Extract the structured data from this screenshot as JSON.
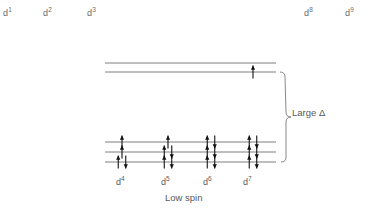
{
  "diagram": {
    "title_caption": "Low spin",
    "delta_label": "Large Δ",
    "accent_color": "#111111",
    "line_color": "#6f7072",
    "text_color": "#58595b",
    "background": "#ffffff"
  },
  "top_labels": [
    {
      "text": "d1",
      "base": "d",
      "sup": "1",
      "x": 3,
      "y": 6
    },
    {
      "text": "d2",
      "base": "d",
      "sup": "2",
      "x": 43,
      "y": 6
    },
    {
      "text": "d3",
      "base": "d",
      "sup": "3",
      "x": 87,
      "y": 6
    },
    {
      "text": "d8",
      "base": "d",
      "sup": "8",
      "x": 304,
      "y": 6
    },
    {
      "text": "d9",
      "base": "d",
      "sup": "9",
      "x": 345,
      "y": 6
    }
  ],
  "column_labels": [
    {
      "base": "d",
      "sup": "4",
      "x": 116,
      "y": 175
    },
    {
      "base": "d",
      "sup": "5",
      "x": 161,
      "y": 175
    },
    {
      "base": "d",
      "sup": "6",
      "x": 203,
      "y": 175
    },
    {
      "base": "d",
      "sup": "7",
      "x": 243,
      "y": 175
    }
  ],
  "chart_data": {
    "type": "diagram",
    "title": "Low spin",
    "annotation": "Large Δ",
    "level_sets": [
      {
        "name": "eg",
        "lines": [
          {
            "y": 63
          },
          {
            "y": 72
          }
        ]
      },
      {
        "name": "t2g",
        "lines": [
          {
            "y": 142
          },
          {
            "y": 152
          },
          {
            "y": 162
          }
        ]
      }
    ],
    "line_extent": {
      "x1": 105,
      "x2": 276
    },
    "columns": [
      {
        "label": "d4",
        "center_x": 122,
        "eg_electrons": [
          0,
          0
        ],
        "t2g_electrons": [
          1,
          1,
          2
        ]
      },
      {
        "label": "d5",
        "center_x": 168,
        "eg_electrons": [
          0,
          0
        ],
        "t2g_electrons": [
          1,
          2,
          2
        ]
      },
      {
        "label": "d6",
        "center_x": 211,
        "eg_electrons": [
          0,
          0
        ],
        "t2g_electrons": [
          2,
          2,
          2
        ]
      },
      {
        "label": "d7",
        "center_x": 253,
        "eg_electrons": [
          0,
          1
        ],
        "t2g_electrons": [
          2,
          2,
          2
        ]
      }
    ],
    "brace": {
      "x": 281,
      "y_top": 72,
      "y_bottom": 162,
      "label_x": 292,
      "label_y": 113
    }
  }
}
